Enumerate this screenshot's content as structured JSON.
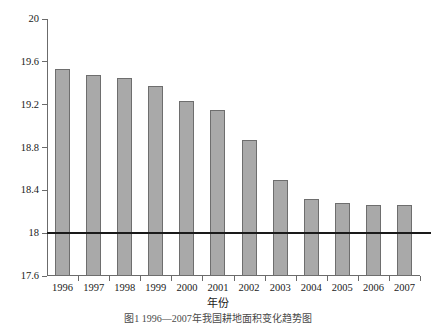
{
  "chart_data": {
    "type": "bar",
    "title": "",
    "subtitle": "",
    "xlabel": "年份",
    "ylabel": "面积(亿亩)",
    "categories": [
      "1996",
      "1997",
      "1998",
      "1999",
      "2000",
      "2001",
      "2002",
      "2003",
      "2004",
      "2005",
      "2006",
      "2007"
    ],
    "values": [
      19.53,
      19.48,
      19.45,
      19.37,
      19.23,
      19.15,
      18.87,
      18.5,
      18.32,
      18.28,
      18.26,
      18.26
    ],
    "series": [
      {
        "name": "面积(亿亩)",
        "values": [
          19.53,
          19.48,
          19.45,
          19.37,
          19.23,
          19.15,
          18.87,
          18.5,
          18.32,
          18.28,
          18.26,
          18.26
        ]
      }
    ],
    "ylim": [
      17.6,
      20.0
    ],
    "ytick_labels": [
      "20",
      "19.6",
      "19.2",
      "18.8",
      "18.4",
      "18",
      "17.6"
    ],
    "ytick_values": [
      20,
      19.6,
      19.2,
      18.8,
      18.4,
      18,
      17.6
    ],
    "grid": false,
    "legend": "none",
    "annotations": [
      {
        "name": "reference-line",
        "type": "hline",
        "value": 18,
        "label": "18"
      }
    ],
    "bar_color": "#a9a9a9",
    "bar_edge_color": "#6e6e6e",
    "axis_color": "#6b6b6b",
    "reference_line_color": "#1a1a1a"
  },
  "caption": {
    "text": "图1  1996—2007年我国耕地面积变化趋势图"
  }
}
